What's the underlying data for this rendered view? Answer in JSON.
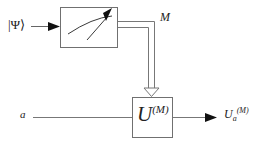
{
  "figure": {
    "background_color": "#ffffff",
    "line_color": "#555555",
    "text_color": "#222222",
    "width": 265,
    "height": 147
  },
  "labels": {
    "input_state": "|Ψ⟩",
    "measurement_result": "M",
    "ancilla_input": "a",
    "unitary_symbol": "U",
    "unitary_superscript": "(M)",
    "output_symbol": "U",
    "output_subscript": "a",
    "output_superscript": "(M)"
  },
  "nodes": [
    {
      "name": "meter-box",
      "label": "measurement-apparatus",
      "x": 60,
      "y": 7,
      "width": 58,
      "height": 41
    },
    {
      "name": "unitary-box",
      "label": "U^(M)",
      "x": 132,
      "y": 97,
      "width": 41,
      "height": 41
    }
  ],
  "wires": [
    {
      "name": "quantum-input-wire",
      "type": "quantum",
      "from": "input_state",
      "to": "meter-box"
    },
    {
      "name": "classical-channel-wire",
      "type": "classical-double",
      "from": "meter-box",
      "to": "unitary-box",
      "label": "M"
    },
    {
      "name": "ancilla-input-wire",
      "type": "quantum",
      "from": "ancilla_input",
      "to": "unitary-box"
    },
    {
      "name": "output-wire",
      "type": "quantum",
      "from": "unitary-box",
      "to": "output_symbol"
    }
  ]
}
